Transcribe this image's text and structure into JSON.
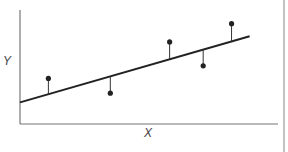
{
  "chart_data": {
    "type": "scatter",
    "title": "",
    "xlabel": "X",
    "ylabel": "Y",
    "grid": false,
    "legend": null,
    "regression_line": {
      "x0": 0.0,
      "y0": 0.19,
      "x1": 0.89,
      "y1": 0.77
    },
    "points": [
      {
        "x": 0.11,
        "y": 0.4,
        "fitted": 0.28,
        "residual": 0.12
      },
      {
        "x": 0.35,
        "y": 0.27,
        "fitted": 0.42,
        "residual": -0.15
      },
      {
        "x": 0.58,
        "y": 0.72,
        "fitted": 0.57,
        "residual": 0.15
      },
      {
        "x": 0.71,
        "y": 0.51,
        "fitted": 0.65,
        "residual": -0.14
      },
      {
        "x": 0.82,
        "y": 0.88,
        "fitted": 0.73,
        "residual": 0.15
      }
    ],
    "xlim": [
      0,
      1
    ],
    "ylim": [
      0,
      1
    ]
  },
  "labels": {
    "x": "X",
    "y": "Y"
  },
  "colors": {
    "ink": "#222222",
    "axis": "#777777",
    "border": "#999999"
  }
}
